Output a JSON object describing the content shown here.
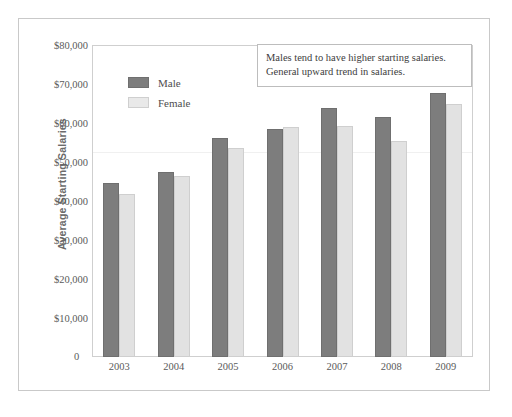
{
  "chart_data": {
    "type": "bar",
    "title": "",
    "xlabel": "",
    "ylabel": "Average Starting Salaries",
    "categories": [
      "2003",
      "2004",
      "2005",
      "2006",
      "2007",
      "2008",
      "2009"
    ],
    "series": [
      {
        "name": "Male",
        "color": "#7d7d7d",
        "values": [
          44600,
          47500,
          56100,
          58400,
          63800,
          61500,
          67600
        ]
      },
      {
        "name": "Female",
        "color": "#e2e2e2",
        "values": [
          41700,
          46400,
          53700,
          59000,
          59300,
          55500,
          64800
        ]
      }
    ],
    "ylim": [
      0,
      80000
    ],
    "ytick_values": [
      80000,
      70000,
      60000,
      50000,
      40000,
      30000,
      20000,
      10000,
      0
    ],
    "ytick_labels": [
      "$80,000",
      "$70,000",
      "$60,000",
      "$50,000",
      "$40,000",
      "$30,000",
      "$20,000",
      "$10,000",
      "0"
    ],
    "zero_label": "0",
    "grid": false,
    "legend_position": "upper-left-inside",
    "annotations": [
      "Males tend to have higher starting salaries.",
      "General upward trend in salaries."
    ]
  },
  "legend": {
    "items": [
      {
        "label": "Male"
      },
      {
        "label": "Female"
      }
    ]
  },
  "annotation": {
    "line1": "Males tend to have higher starting salaries.",
    "line2": "General upward trend in salaries."
  },
  "axes": {
    "y_title": "Average Starting Salaries",
    "y_labels": [
      "$80,000",
      "$70,000",
      "$60,000",
      "$50,000",
      "$40,000",
      "$30,000",
      "$20,000",
      "$10,000"
    ],
    "zero": "0",
    "x_labels": [
      "2003",
      "2004",
      "2005",
      "2006",
      "2007",
      "2008",
      "2009"
    ]
  }
}
